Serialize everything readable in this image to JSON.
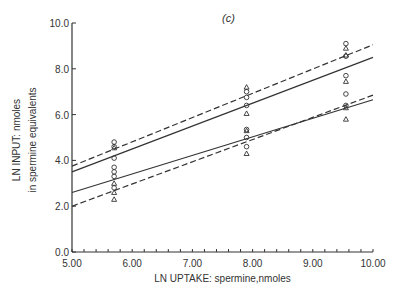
{
  "chart_data": {
    "type": "scatter",
    "panel_label": "(c)",
    "title": "",
    "xlabel": "LN UPTAKE: spermine,nmoles",
    "ylabel_line1": "LN INPUT: nmoles",
    "ylabel_line2": "in spermine equivalents",
    "xlim": [
      5.0,
      10.0
    ],
    "ylim": [
      0.0,
      10.0
    ],
    "x_ticks": [
      "5.00",
      "6.00",
      "7.00",
      "8.00",
      "9.00",
      "10.00"
    ],
    "y_ticks": [
      "0.0",
      "2.0",
      "4.0",
      "6.0",
      "8.0",
      "10.0"
    ],
    "grid": false,
    "lines": [
      {
        "name": "upper-confidence-dashed",
        "style": "dashed",
        "x": [
          5.0,
          10.0
        ],
        "y": [
          3.75,
          9.05
        ]
      },
      {
        "name": "upper-regression-solid",
        "style": "solid",
        "x": [
          5.0,
          10.0
        ],
        "y": [
          3.5,
          8.5
        ]
      },
      {
        "name": "lower-regression-solid",
        "style": "solid",
        "x": [
          5.0,
          10.0
        ],
        "y": [
          2.6,
          6.65
        ]
      },
      {
        "name": "lower-confidence-dashed",
        "style": "dashed",
        "x": [
          5.0,
          10.0
        ],
        "y": [
          2.0,
          6.85
        ]
      }
    ],
    "series": [
      {
        "name": "circles",
        "marker": "circle",
        "points": [
          [
            5.7,
            4.8
          ],
          [
            5.7,
            4.6
          ],
          [
            5.7,
            4.1
          ],
          [
            5.7,
            3.7
          ],
          [
            5.7,
            3.5
          ],
          [
            5.7,
            3.3
          ],
          [
            5.7,
            2.8
          ],
          [
            7.9,
            7.0
          ],
          [
            7.9,
            6.75
          ],
          [
            7.9,
            6.4
          ],
          [
            7.9,
            5.35
          ],
          [
            7.9,
            5.0
          ],
          [
            7.9,
            4.6
          ],
          [
            9.55,
            9.1
          ],
          [
            9.55,
            8.55
          ],
          [
            9.55,
            7.7
          ],
          [
            9.55,
            6.9
          ],
          [
            9.55,
            6.4
          ]
        ]
      },
      {
        "name": "triangles",
        "marker": "triangle",
        "points": [
          [
            5.7,
            4.55
          ],
          [
            5.7,
            3.0
          ],
          [
            5.7,
            2.6
          ],
          [
            5.7,
            2.3
          ],
          [
            7.9,
            7.2
          ],
          [
            7.9,
            6.05
          ],
          [
            7.9,
            5.3
          ],
          [
            7.9,
            4.3
          ],
          [
            9.55,
            8.9
          ],
          [
            9.55,
            8.6
          ],
          [
            9.55,
            7.45
          ],
          [
            9.55,
            6.3
          ],
          [
            9.55,
            5.8
          ]
        ]
      }
    ]
  }
}
